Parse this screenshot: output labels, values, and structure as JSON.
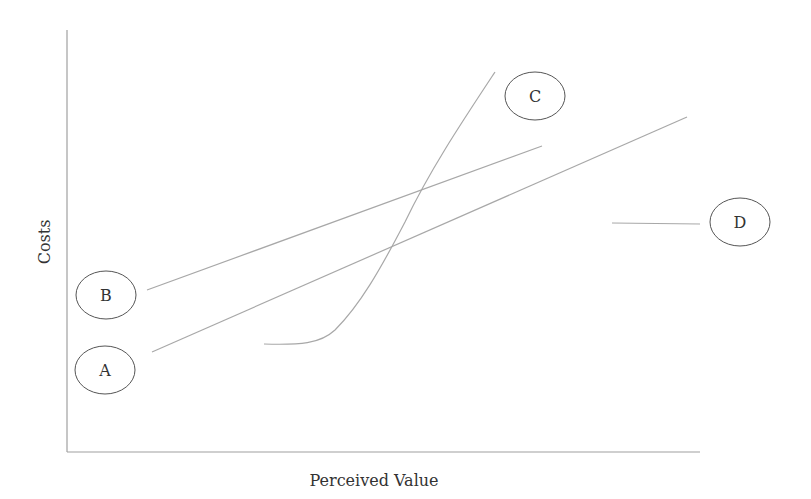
{
  "diagram": {
    "x_axis_label": "Perceived Value",
    "y_axis_label": "Costs",
    "nodes": [
      {
        "id": "A",
        "label": "A",
        "cx": 105,
        "cy": 370,
        "rx": 30,
        "ry": 24
      },
      {
        "id": "B",
        "label": "B",
        "cx": 106,
        "cy": 295,
        "rx": 30,
        "ry": 24
      },
      {
        "id": "C",
        "label": "C",
        "cx": 535,
        "cy": 96,
        "rx": 30,
        "ry": 24
      },
      {
        "id": "D",
        "label": "D",
        "cx": 740,
        "cy": 222,
        "rx": 30,
        "ry": 24
      }
    ],
    "lines": [
      {
        "id": "line-a",
        "from": "A",
        "x1": 152,
        "y1": 352,
        "x2": 687,
        "y2": 117,
        "shape": "straight"
      },
      {
        "id": "line-b",
        "from": "B",
        "x1": 147,
        "y1": 290,
        "x2": 542,
        "y2": 146,
        "shape": "straight"
      },
      {
        "id": "line-c",
        "from": "C",
        "shape": "s-curve"
      },
      {
        "id": "line-d",
        "from": "D",
        "x1": 612,
        "y1": 223,
        "x2": 700,
        "y2": 224,
        "shape": "flat"
      }
    ],
    "colors": {
      "line": "#a8a8a8",
      "axis": "#a0a0a0",
      "circle_stroke": "#555555",
      "text": "#333333"
    }
  }
}
